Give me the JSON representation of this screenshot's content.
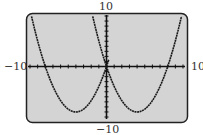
{
  "chart_data": {
    "type": "line",
    "title": "",
    "xlabel": "",
    "ylabel": "",
    "xlim": [
      -10,
      10
    ],
    "ylim": [
      -10,
      10
    ],
    "xscl": 1,
    "yscl": 1,
    "grid": false,
    "series": [
      {
        "name": "left parabola",
        "equation": "y = (9/16)(x+4)^2 - 9",
        "x_range": [
          -10,
          0.3
        ],
        "vertex": [
          -4,
          -9
        ],
        "roots": [
          -8,
          0
        ]
      },
      {
        "name": "right parabola",
        "equation": "y = (9/16)(x-4)^2 - 9",
        "x_range": [
          -2.1,
          10
        ],
        "vertex": [
          4,
          -9
        ],
        "roots": [
          0,
          8
        ]
      }
    ]
  },
  "labels": {
    "ymax": "10",
    "ymin": "-10",
    "xmin": "−10",
    "xmax": "10",
    "ymin_display": "−10"
  },
  "colors": {
    "screen_bg": "#d4d4d4",
    "frame": "#222222",
    "curve": "#1a1a1a",
    "axis": "#111111"
  }
}
